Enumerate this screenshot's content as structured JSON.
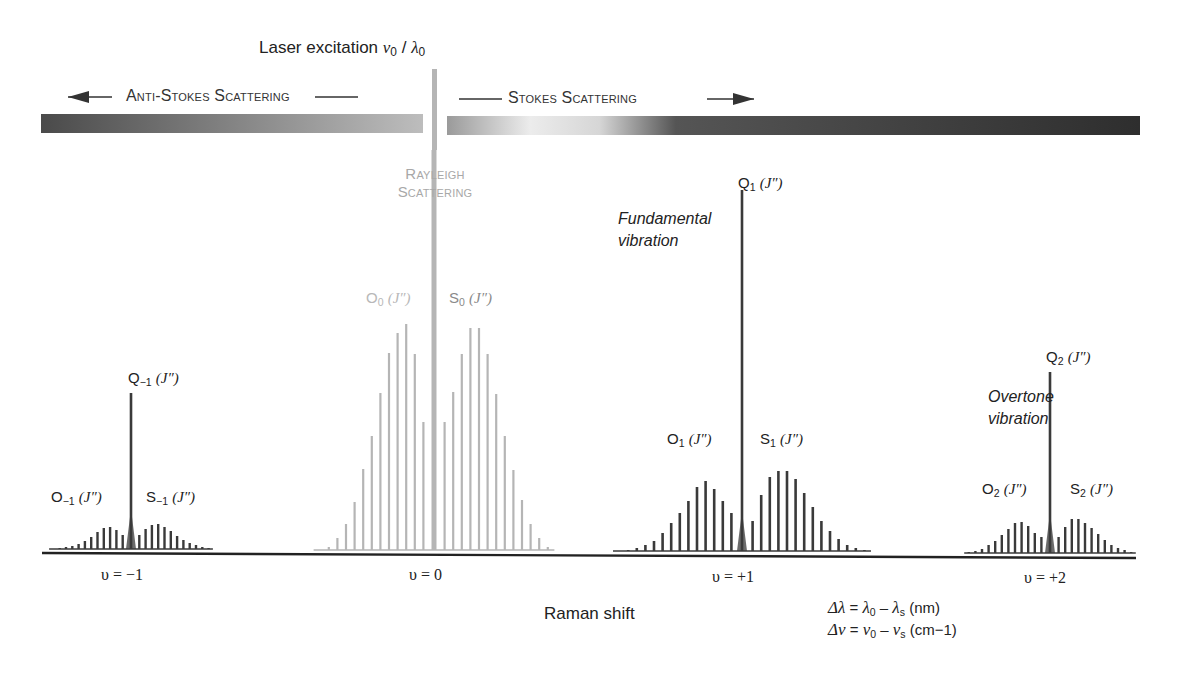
{
  "header": {
    "title_text": "Laser excitation",
    "title_symbol_nu": "ν",
    "title_symbol_lambda": "λ",
    "title_sub": "0",
    "title_sep": " / "
  },
  "direction_bar": {
    "anti_stokes_label": "Anti-Stokes Scattering",
    "stokes_label": "Stokes Scattering",
    "anti_stokes_gradient": [
      "#4a4a4a",
      "#bdbdbd"
    ],
    "stokes_gradient": [
      "#9a9a9a",
      "#f2f2f2",
      "#3a3a3a"
    ]
  },
  "rayleigh": {
    "label_line1": "Rayleigh",
    "label_line2": "Scattering",
    "color": "#b5b5b5"
  },
  "annotations": {
    "fundamental_line1": "Fundamental",
    "fundamental_line2": "vibration",
    "overtone_line1": "Overtone",
    "overtone_line2": "vibration"
  },
  "branches": {
    "q_minus1": {
      "letter": "Q",
      "sub": "−1",
      "j": "(J″)"
    },
    "o_minus1": {
      "letter": "O",
      "sub": "−1",
      "j": "(J″)"
    },
    "s_minus1": {
      "letter": "S",
      "sub": "−1",
      "j": "(J″)"
    },
    "o_0": {
      "letter": "O",
      "sub": "0",
      "j": "(J″)"
    },
    "s_0": {
      "letter": "S",
      "sub": "0",
      "j": "(J″)"
    },
    "q_1": {
      "letter": "Q",
      "sub": "1",
      "j": "(J″)"
    },
    "o_1": {
      "letter": "O",
      "sub": "1",
      "j": "(J″)"
    },
    "s_1": {
      "letter": "S",
      "sub": "1",
      "j": "(J″)"
    },
    "q_2": {
      "letter": "Q",
      "sub": "2",
      "j": "(J″)"
    },
    "o_2": {
      "letter": "O",
      "sub": "2",
      "j": "(J″)"
    },
    "s_2": {
      "letter": "S",
      "sub": "2",
      "j": "(J″)"
    }
  },
  "x_labels": {
    "v_minus1": "υ = −1",
    "v_0": "υ = 0",
    "v_plus1": "υ = +1",
    "v_plus2": "υ = +2"
  },
  "axis": {
    "title": "Raman shift",
    "formula_lambda": "Δλ = λ₀ − λₛ (nm)",
    "formula_nu": "Δν = ν₀ − νₛ (cm−1)",
    "formula_lambda_parts": {
      "delta": "Δλ",
      "eq": " = ",
      "a": "λ",
      "a_sub": "0",
      "minus": " – ",
      "b": "λ",
      "b_sub": "s",
      "unit": " (nm)"
    },
    "formula_nu_parts": {
      "delta": "Δν",
      "eq": " = ",
      "a": "ν",
      "a_sub": "0",
      "minus": " – ",
      "b": "ν",
      "b_sub": "s",
      "unit": " (cm",
      "unit_sup": "−1",
      "unit_end": ")"
    }
  },
  "chart_data": {
    "type": "bar",
    "xlabel": "Raman shift (Δλ = λ0 − λs nm; Δν = ν0 − νs cm−1)",
    "ylabel": "",
    "grid": false,
    "groups": [
      {
        "name": "υ = −1 (Anti-Stokes)",
        "center_x": 131,
        "color": "#3a3a3a",
        "q_height": 160,
        "o_branch": [
          1,
          2,
          3,
          5,
          8,
          12,
          17,
          21,
          22,
          19,
          14
        ],
        "s_branch": [
          14,
          20,
          24,
          25,
          22,
          18,
          13,
          9,
          6,
          4,
          2,
          1
        ]
      },
      {
        "name": "υ = 0 (Rayleigh)",
        "center_x": 434,
        "color": "#b5b5b5",
        "q_height": 500,
        "o_branch": [
          3,
          12,
          26,
          48,
          81,
          114,
          157,
          197,
          217,
          226,
          196,
          128
        ],
        "s_branch": [
          128,
          158,
          196,
          222,
          222,
          196,
          156,
          114,
          80,
          50,
          26,
          12,
          3
        ]
      },
      {
        "name": "υ = +1 (Fundamental vibration, Stokes)",
        "center_x": 742,
        "color": "#3a3a3a",
        "q_height": 364,
        "o_branch": [
          1,
          3,
          6,
          10,
          18,
          28,
          38,
          50,
          64,
          70,
          62,
          50,
          38
        ],
        "s_branch": [
          30,
          56,
          74,
          80,
          80,
          72,
          58,
          44,
          30,
          20,
          12,
          6,
          3,
          1
        ]
      },
      {
        "name": "υ = +2 (Overtone vibration, Stokes)",
        "center_x": 1050,
        "color": "#3a3a3a",
        "q_height": 200,
        "o_branch": [
          1,
          2,
          4,
          8,
          12,
          18,
          24,
          30,
          31,
          27,
          20,
          16
        ],
        "s_branch": [
          16,
          26,
          34,
          34,
          30,
          25,
          19,
          13,
          8,
          5,
          3,
          1
        ]
      }
    ],
    "x_tick_labels": [
      "υ = −1",
      "υ = 0",
      "υ = +1",
      "υ = +2"
    ],
    "annotations": [
      "Anti-Stokes Scattering",
      "Stokes Scattering",
      "Rayleigh Scattering",
      "Fundamental vibration",
      "Overtone vibration"
    ]
  }
}
